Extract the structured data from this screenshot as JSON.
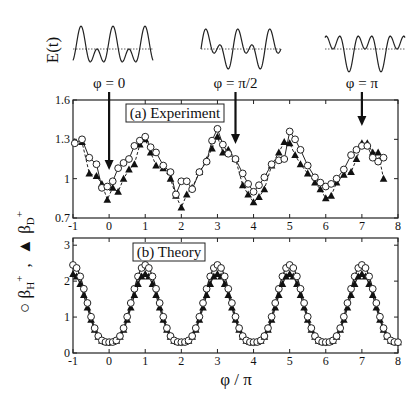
{
  "figure": {
    "waveform_label": "E(t)",
    "waveforms": [
      {
        "label": "φ = 0",
        "phase": 0,
        "arrow_x": 0
      },
      {
        "label": "φ = π/2",
        "phase": 0.5,
        "arrow_x": 3.5
      },
      {
        "label": "φ = π",
        "phase": 1,
        "arrow_x": 7
      }
    ],
    "ylabel": "○ βH+ , ▲ βD+",
    "ylabel_parts": {
      "circle": "○",
      "beta_h": "β",
      "h_sub": "H",
      "h_sup": "+",
      "sep": ",",
      "triangle": "▲",
      "beta_d": "β",
      "d_sub": "D",
      "d_sup": "+"
    },
    "xlabel": "φ / π"
  },
  "chart_data": [
    {
      "type": "line",
      "title": "(a) Experiment",
      "xlabel": "φ / π",
      "ylabel": "βH+ (○), βD+ (▲)",
      "xlim": [
        -1,
        8
      ],
      "ylim": [
        0.7,
        1.6
      ],
      "xticks": [
        -1,
        0,
        1,
        2,
        3,
        4,
        5,
        6,
        7,
        8
      ],
      "yticks": [
        0.7,
        1,
        1.3,
        1.6
      ],
      "ytick_labels": [
        "0.7",
        "1",
        "1.3",
        "1.6"
      ],
      "grid": false,
      "series": [
        {
          "name": "βH+",
          "marker": "open-circle",
          "line": "solid",
          "x": [
            -0.95,
            -0.75,
            -0.55,
            -0.35,
            -0.2,
            -0.05,
            0.1,
            0.25,
            0.4,
            0.55,
            0.7,
            0.85,
            1.0,
            1.15,
            1.3,
            1.5,
            1.7,
            1.85,
            2.0,
            2.15,
            2.3,
            2.5,
            2.7,
            2.85,
            3.0,
            3.15,
            3.3,
            3.5,
            3.7,
            3.85,
            4.0,
            4.15,
            4.3,
            4.5,
            4.7,
            4.85,
            5.0,
            5.15,
            5.3,
            5.5,
            5.7,
            5.85,
            6.0,
            6.15,
            6.3,
            6.5,
            6.7,
            6.85,
            7.0,
            7.15,
            7.3,
            7.45,
            7.6
          ],
          "values": [
            1.27,
            1.3,
            1.16,
            1.11,
            0.93,
            0.94,
            0.98,
            1.08,
            1.12,
            1.15,
            1.25,
            1.29,
            1.32,
            1.24,
            1.2,
            1.1,
            1.05,
            0.88,
            0.98,
            0.98,
            0.92,
            1.05,
            1.13,
            1.29,
            1.38,
            1.26,
            1.19,
            1.15,
            1.04,
            0.96,
            0.9,
            0.95,
            1.01,
            1.11,
            1.14,
            1.15,
            1.36,
            1.3,
            1.22,
            1.1,
            1.01,
            0.97,
            0.94,
            0.96,
            1.0,
            1.07,
            1.18,
            1.22,
            1.25,
            1.25,
            1.16,
            1.13,
            1.16
          ]
        },
        {
          "name": "βD+",
          "marker": "filled-triangle",
          "line": "dashed",
          "x": [
            -0.95,
            -0.75,
            -0.55,
            -0.35,
            -0.2,
            -0.05,
            0.1,
            0.25,
            0.4,
            0.55,
            0.7,
            0.85,
            1.0,
            1.15,
            1.3,
            1.5,
            1.7,
            1.85,
            2.0,
            2.15,
            2.3,
            2.5,
            2.7,
            2.85,
            3.0,
            3.15,
            3.3,
            3.5,
            3.7,
            3.85,
            4.0,
            4.15,
            4.3,
            4.5,
            4.7,
            4.85,
            5.0,
            5.15,
            5.3,
            5.5,
            5.7,
            5.85,
            6.0,
            6.15,
            6.3,
            6.5,
            6.7,
            6.85,
            7.0,
            7.15,
            7.3,
            7.45,
            7.6
          ],
          "values": [
            1.28,
            1.28,
            1.04,
            1.02,
            0.96,
            0.84,
            0.93,
            0.9,
            1.0,
            1.07,
            1.11,
            1.26,
            1.3,
            1.2,
            1.1,
            1.08,
            1.0,
            0.87,
            0.78,
            0.88,
            0.93,
            1.05,
            1.14,
            1.23,
            1.32,
            1.2,
            1.22,
            1.15,
            0.95,
            0.88,
            0.82,
            0.86,
            0.92,
            1.1,
            1.2,
            1.28,
            1.27,
            1.18,
            1.11,
            1.04,
            0.97,
            0.92,
            0.85,
            0.87,
            0.97,
            1.03,
            1.05,
            1.15,
            1.27,
            1.27,
            1.2,
            1.2,
            1.0
          ]
        }
      ],
      "annotations": [
        {
          "text": "φ = 0",
          "arrow_x": 0
        },
        {
          "text": "φ = π/2",
          "arrow_x": 3.5
        },
        {
          "text": "φ = π",
          "arrow_x": 7
        }
      ]
    },
    {
      "type": "line",
      "title": "(b) Theory",
      "xlabel": "φ / π",
      "ylabel": "βH+ (○), βD+ (▲)",
      "xlim": [
        -1,
        8
      ],
      "ylim": [
        0,
        3.2
      ],
      "xticks": [
        -1,
        0,
        1,
        2,
        3,
        4,
        5,
        6,
        7,
        8
      ],
      "yticks": [
        0,
        1,
        2,
        3
      ],
      "ytick_labels": [
        "0",
        "1",
        "2",
        "3"
      ],
      "grid": false,
      "series": [
        {
          "name": "βH+",
          "marker": "open-circle",
          "line": "solid",
          "peak": 2.45,
          "trough": 0.3,
          "period": 2,
          "peak_at": [
            -1,
            1,
            3,
            5,
            7
          ],
          "trough_at": [
            0,
            2,
            4,
            6,
            8
          ]
        },
        {
          "name": "βD+",
          "marker": "filled-triangle",
          "line": "solid",
          "peak": 2.2,
          "trough": 0.3,
          "period": 2,
          "peak_at": [
            -1,
            1,
            3,
            5,
            7
          ],
          "trough_at": [
            0,
            2,
            4,
            6,
            8
          ]
        }
      ]
    }
  ]
}
